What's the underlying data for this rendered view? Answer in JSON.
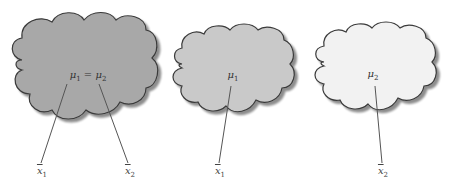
{
  "diagram": {
    "colors": {
      "cloud_dark": "#a8a8a8",
      "cloud_medium": "#c9c9c9",
      "cloud_light": "#f2f2f2",
      "outline": "#3a3a3a",
      "line": "#555555"
    },
    "clouds": [
      {
        "name": "combined-population",
        "label": {
          "sym": "μ",
          "sub1": "1",
          "eq": " = ",
          "sym2": "μ",
          "sub2": "2"
        },
        "samples": [
          {
            "sym": "x",
            "sub": "1"
          },
          {
            "sym": "x",
            "sub": "2"
          }
        ]
      },
      {
        "name": "population-1",
        "label": {
          "sym": "μ",
          "sub1": "1"
        },
        "samples": [
          {
            "sym": "x",
            "sub": "1"
          }
        ]
      },
      {
        "name": "population-2",
        "label": {
          "sym": "μ",
          "sub1": "2"
        },
        "samples": [
          {
            "sym": "x",
            "sub": "2"
          }
        ]
      }
    ]
  }
}
